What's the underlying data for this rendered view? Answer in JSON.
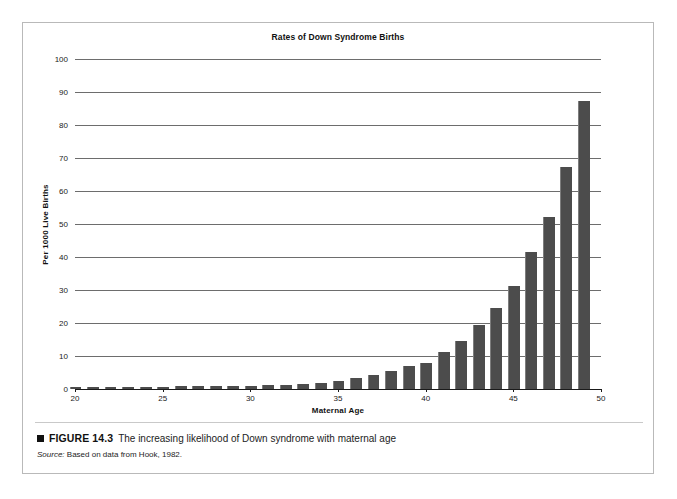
{
  "figure": {
    "caption_marker": "■",
    "figure_number": "FIGURE 14.3",
    "caption_text": "The increasing likelihood of Down syndrome with maternal age",
    "source_label": "Source:",
    "source_text": "Based on data from Hook, 1982."
  },
  "colors": {
    "bar": "#4c4c4c",
    "gridline": "#6d6d6d",
    "axis": "#1a1a1a",
    "frame": "#b9b9b9"
  },
  "chart_data": {
    "type": "bar",
    "title": "Rates of Down Syndrome Births",
    "xlabel": "Maternal Age",
    "ylabel": "Per 1000 Live Births",
    "xlim": [
      20,
      50
    ],
    "ylim": [
      0,
      100
    ],
    "ytick_labels": [
      "0",
      "10",
      "20",
      "30",
      "40",
      "50",
      "60",
      "70",
      "80",
      "90",
      "100"
    ],
    "yticks": [
      0,
      10,
      20,
      30,
      40,
      50,
      60,
      70,
      80,
      90,
      100
    ],
    "xtick_labels": [
      "20",
      "25",
      "30",
      "35",
      "40",
      "45",
      "50"
    ],
    "xticks": [
      20,
      25,
      30,
      35,
      40,
      45,
      50
    ],
    "grid": true,
    "legend": "none",
    "categories": [
      20,
      21,
      22,
      23,
      24,
      25,
      26,
      27,
      28,
      29,
      30,
      31,
      32,
      33,
      34,
      35,
      36,
      37,
      38,
      39,
      40,
      41,
      42,
      43,
      44,
      45,
      46,
      47,
      48,
      49
    ],
    "values": [
      0.6,
      0.6,
      0.6,
      0.6,
      0.7,
      0.7,
      0.8,
      0.8,
      0.9,
      0.9,
      1.0,
      1.1,
      1.3,
      1.5,
      1.8,
      2.4,
      3.2,
      4.2,
      5.6,
      7.0,
      8.0,
      11.3,
      14.7,
      19.5,
      24.6,
      31.3,
      41.4,
      52.0,
      67.3,
      87.3
    ],
    "series_name": "Rate of Down syndrome per 1000 live births"
  }
}
